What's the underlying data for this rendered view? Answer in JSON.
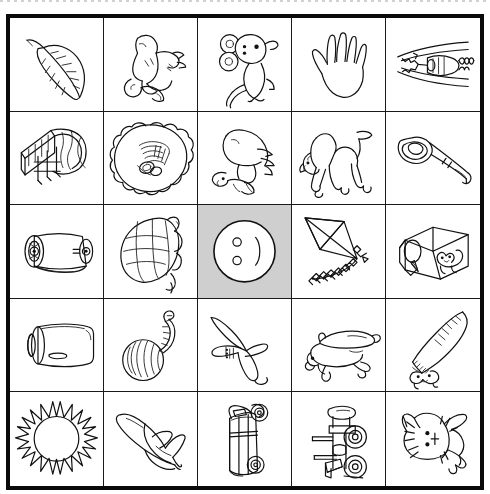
{
  "page": {
    "background_color": "#ffffff",
    "border_color": "#0a0a0a",
    "line_color": "#1a1a1a",
    "highlight_color": "#cfcfcf",
    "ink_color": "#111111",
    "rows": 5,
    "columns": 5
  },
  "grid": {
    "cells": [
      {
        "row": 1,
        "col": 1,
        "icon_name": "leaf-icon",
        "label": "leaf",
        "highlighted": false
      },
      {
        "row": 1,
        "col": 2,
        "icon_name": "goat-icon",
        "label": "goat",
        "highlighted": false
      },
      {
        "row": 1,
        "col": 3,
        "icon_name": "mouse-icon",
        "label": "mouse",
        "highlighted": false
      },
      {
        "row": 1,
        "col": 4,
        "icon_name": "hand-icon",
        "label": "hand",
        "highlighted": false
      },
      {
        "row": 1,
        "col": 5,
        "icon_name": "zipper-icon",
        "label": "zipper",
        "highlighted": false
      },
      {
        "row": 2,
        "col": 1,
        "icon_name": "gate-icon",
        "label": "gate",
        "highlighted": false
      },
      {
        "row": 2,
        "col": 2,
        "icon_name": "nest-icon",
        "label": "nest",
        "highlighted": false
      },
      {
        "row": 2,
        "col": 3,
        "icon_name": "goat-kid-icon",
        "label": "goat kid",
        "highlighted": false
      },
      {
        "row": 2,
        "col": 4,
        "icon_name": "camel-icon",
        "label": "camel",
        "highlighted": false
      },
      {
        "row": 2,
        "col": 5,
        "icon_name": "key-icon",
        "label": "key",
        "highlighted": false
      },
      {
        "row": 3,
        "col": 1,
        "icon_name": "paper-roll-icon",
        "label": "paper roll",
        "highlighted": false
      },
      {
        "row": 3,
        "col": 2,
        "icon_name": "turtle-icon",
        "label": "turtle",
        "highlighted": false
      },
      {
        "row": 3,
        "col": 3,
        "icon_name": "button-icon",
        "label": "button",
        "highlighted": true
      },
      {
        "row": 3,
        "col": 4,
        "icon_name": "kite-icon",
        "label": "kite",
        "highlighted": false
      },
      {
        "row": 3,
        "col": 5,
        "icon_name": "doghouse-icon",
        "label": "doghouse",
        "highlighted": false
      },
      {
        "row": 4,
        "col": 1,
        "icon_name": "jar-icon",
        "label": "jar",
        "highlighted": false
      },
      {
        "row": 4,
        "col": 2,
        "icon_name": "yarn-ball-icon",
        "label": "ball of yarn",
        "highlighted": false
      },
      {
        "row": 4,
        "col": 3,
        "icon_name": "airplane-icon",
        "label": "airplane",
        "highlighted": false
      },
      {
        "row": 4,
        "col": 4,
        "icon_name": "dog-icon",
        "label": "dog",
        "highlighted": false
      },
      {
        "row": 4,
        "col": 5,
        "icon_name": "saw-icon",
        "label": "saw",
        "highlighted": false
      },
      {
        "row": 5,
        "col": 1,
        "icon_name": "sun-icon",
        "label": "sun",
        "highlighted": false
      },
      {
        "row": 5,
        "col": 2,
        "icon_name": "banana-icon",
        "label": "banana",
        "highlighted": false
      },
      {
        "row": 5,
        "col": 3,
        "icon_name": "truck-icon",
        "label": "truck",
        "highlighted": false
      },
      {
        "row": 5,
        "col": 4,
        "icon_name": "tractor-icon",
        "label": "tractor",
        "highlighted": false
      },
      {
        "row": 5,
        "col": 5,
        "icon_name": "cat-icon",
        "label": "cat",
        "highlighted": false
      }
    ]
  }
}
